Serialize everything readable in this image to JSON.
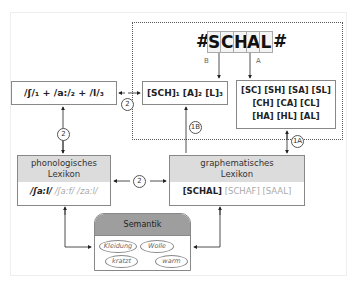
{
  "word_input": {
    "prefix": "#",
    "letters": [
      "S",
      "C",
      "H",
      "A",
      "L"
    ],
    "suffix": "#",
    "route_labels": {
      "B": "B",
      "A": "A"
    }
  },
  "phoneme_box": {
    "text": "/ʃ/₁ + /a:/₂ + /l/₃"
  },
  "grapheme_segment_box": {
    "text": "[SCH]₁  [A]₂  [L]₃"
  },
  "bigram_box": {
    "lines": [
      "[SC] [SH] [SA] [SL]",
      "[CH] [CA] [CL]",
      "[HA] [HL] [AL]"
    ]
  },
  "phonological_lexicon": {
    "title_line1": "phonologisches",
    "title_line2": "Lexikon",
    "active": "/ʃa:l/",
    "competitors": [
      "/ʃa:f/",
      "/za:l/"
    ]
  },
  "graphematic_lexicon": {
    "title_line1": "graphematisches",
    "title_line2": "Lexikon",
    "active": "[SCHAL]",
    "competitors": [
      "[SCHAF]",
      "[SAAL]"
    ]
  },
  "semantics": {
    "title": "Semantik",
    "features": [
      "Kleidung",
      "Wolle",
      "kratzt",
      "warm"
    ]
  },
  "route_markers": {
    "m2_a": "2",
    "m2_b": "2",
    "m2_c": "2",
    "m1b": "1B",
    "m1a": "1A"
  }
}
